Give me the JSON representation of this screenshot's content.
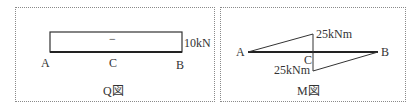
{
  "q_diagram": {
    "caption": "Q図",
    "sign": "−",
    "value_label": "10kN",
    "points": {
      "a": "A",
      "c": "C",
      "b": "B"
    }
  },
  "m_diagram": {
    "caption": "M図",
    "top_value_label": "25kNm",
    "bottom_value_label": "25kNm",
    "points": {
      "a": "A",
      "c": "C",
      "b": "B"
    }
  },
  "colors": {
    "line": "#222222",
    "border": "#8a8a8a"
  }
}
